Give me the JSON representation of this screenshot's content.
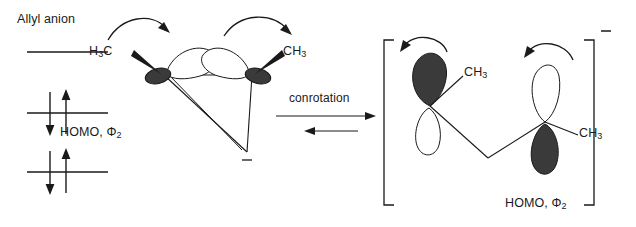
{
  "diagram": {
    "title_left": "Allyl anion",
    "reaction_label": "conrotation",
    "homo_label_left": "HOMO, Φ2",
    "homo_label_right": "HOMO, Φ2",
    "charge_symbol": "–",
    "bracket_charge": "–"
  },
  "energy_diagram": {
    "name": "allyl-anion-mo-energy-levels",
    "levels": [
      {
        "id": "lumo",
        "electrons": 0,
        "label": ""
      },
      {
        "id": "homo",
        "electrons": 2,
        "label": "HOMO, Φ2"
      },
      {
        "id": "bonding",
        "electrons": 2,
        "label": ""
      }
    ],
    "arrow_up": "↑",
    "arrow_down": "↓"
  },
  "reactant": {
    "name": "cyclopropyl-anion",
    "substituents": [
      {
        "id": "left-methyl",
        "label": "H3C",
        "text": "H₃C"
      },
      {
        "id": "right-methyl",
        "label": "CH3",
        "text": "CH₃"
      }
    ],
    "charge": "–",
    "rotation_arrows": [
      {
        "id": "left-conrotation-arrow",
        "direction": "clockwise"
      },
      {
        "id": "right-conrotation-arrow",
        "direction": "clockwise"
      }
    ]
  },
  "product": {
    "name": "allyl-anion-product",
    "charge": "–",
    "substituents": [
      {
        "id": "left-methyl",
        "text": "CH₃"
      },
      {
        "id": "right-methyl",
        "text": "CH₃"
      }
    ],
    "rotation_arrows": [
      {
        "id": "left-rotation-arrow",
        "direction": "counterclockwise"
      },
      {
        "id": "right-rotation-arrow",
        "direction": "counterclockwise"
      }
    ],
    "label": "HOMO, Φ2"
  },
  "colors": {
    "ink": "#1a1a1a",
    "lobe_filled": "#3a3a3a",
    "lobe_empty": "#ffffff",
    "background": "#ffffff"
  },
  "methyl_labels": {
    "reactant_left": "H₃C",
    "reactant_right": "CH₃",
    "product_left": "CH₃",
    "product_right": "CH₃"
  }
}
